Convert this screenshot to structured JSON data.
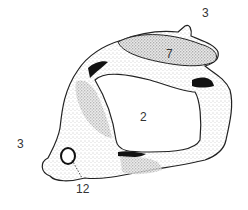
{
  "figure": {
    "style": "stippled line drawing",
    "colors": {
      "ink": "#222222",
      "stipple": "#7a7a7a",
      "background": "#ffffff",
      "label": "#333333"
    }
  },
  "labels": [
    {
      "id": "label-3-top-right",
      "text": "3",
      "x": 202,
      "y": 7
    },
    {
      "id": "label-7",
      "text": "7",
      "x": 166,
      "y": 48
    },
    {
      "id": "label-2",
      "text": "2",
      "x": 140,
      "y": 111
    },
    {
      "id": "label-3-left",
      "text": "3",
      "x": 17,
      "y": 138
    },
    {
      "id": "label-12",
      "text": "12",
      "x": 76,
      "y": 183
    }
  ]
}
